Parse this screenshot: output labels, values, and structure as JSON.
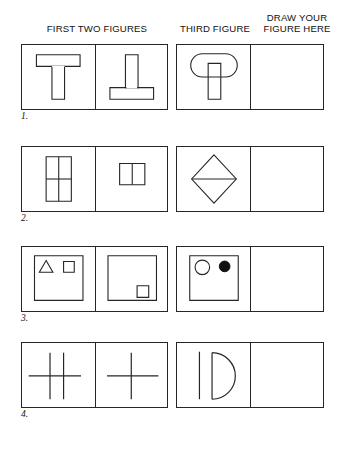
{
  "page": {
    "background_color": "#ffffff",
    "ink_color": "#262626"
  },
  "header": {
    "first_two_label": "FIRST TWO FIGURES",
    "third_label": "THIRD FIGURE",
    "draw_label": "DRAW YOUR\nFIGURE HERE"
  },
  "rows": [
    {
      "number": "1.",
      "cells": [
        {
          "name": "figure-1a",
          "description": "T shape: wide horizontal bar on top of vertical bar"
        },
        {
          "name": "figure-1b",
          "description": "Inverted T shape: vertical bar on top of wide horizontal bar"
        },
        {
          "name": "figure-1c",
          "description": "Rounded rectangle (stadium) overlapping a vertical bar"
        },
        {
          "name": "answer-1",
          "description": "Empty answer box"
        }
      ]
    },
    {
      "number": "2.",
      "cells": [
        {
          "name": "figure-2a",
          "description": "Tall rectangle divided into 2 columns and 2 rows"
        },
        {
          "name": "figure-2b",
          "description": "Small rectangle divided into 2 columns"
        },
        {
          "name": "figure-2c",
          "description": "Diamond with horizontal midline"
        },
        {
          "name": "answer-2",
          "description": "Empty answer box"
        }
      ]
    },
    {
      "number": "3.",
      "cells": [
        {
          "name": "figure-3a",
          "description": "Square containing a small triangle and a small square at top"
        },
        {
          "name": "figure-3b",
          "description": "Square containing a small square at bottom right"
        },
        {
          "name": "figure-3c",
          "description": "Square containing an open circle and a filled circle at top"
        },
        {
          "name": "answer-3",
          "description": "Empty answer box"
        }
      ]
    },
    {
      "number": "4.",
      "cells": [
        {
          "name": "figure-4a",
          "description": "Two vertical lines crossed by one horizontal line"
        },
        {
          "name": "figure-4b",
          "description": "Plus sign: one vertical line crossed by one horizontal line"
        },
        {
          "name": "figure-4c",
          "description": "Letter D shape: vertical line with semicircle"
        },
        {
          "name": "answer-4",
          "description": "Empty answer box"
        }
      ]
    }
  ]
}
